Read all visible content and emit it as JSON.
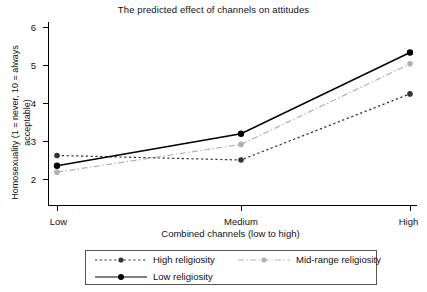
{
  "chart_data": {
    "type": "line",
    "title": "The predicted effect of channels on attitudes",
    "xlabel": "Combined channels (low to high)",
    "ylabel": "Homosexuality (1 = never, 10 = always acceptable)",
    "categories": [
      "Low",
      "Medium",
      "High"
    ],
    "ylim": [
      2,
      6
    ],
    "yticks": [
      "2",
      "3",
      "4",
      "5",
      "6"
    ],
    "grid": false,
    "legend_position": "bottom",
    "series": [
      {
        "name": "High religiosity",
        "values": [
          2.62,
          2.5,
          4.24
        ],
        "color": "#333333",
        "linestyle": "dotted",
        "marker": "circle"
      },
      {
        "name": "Mid-range religiosity",
        "values": [
          2.18,
          2.91,
          5.03
        ],
        "color": "#b0b0b0",
        "linestyle": "dashdot",
        "marker": "circle"
      },
      {
        "name": "Low religiosity",
        "values": [
          2.35,
          3.19,
          5.33
        ],
        "color": "#000000",
        "linestyle": "solid",
        "marker": "circle"
      }
    ]
  },
  "axes": {
    "ytick_labels": [
      "6",
      "5",
      "4",
      "3",
      "2"
    ],
    "xtick_labels": [
      "Low",
      "Medium",
      "High"
    ]
  },
  "legend": {
    "entries": [
      {
        "label": "High religiosity"
      },
      {
        "label": "Mid-range religiosity"
      },
      {
        "label": "Low religiosity"
      }
    ]
  }
}
